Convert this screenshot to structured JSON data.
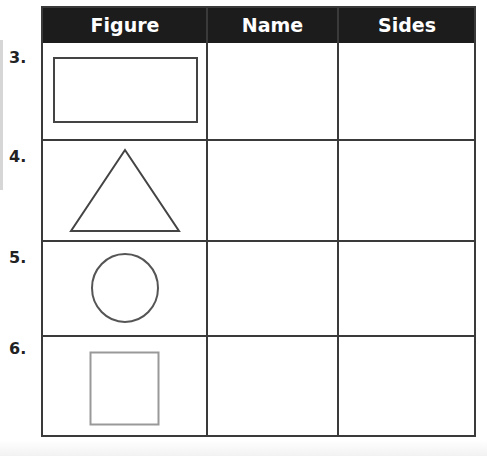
{
  "table": {
    "headers": [
      "Figure",
      "Name",
      "Sides"
    ],
    "header_bg": "#1c1c1c",
    "rows": [
      {
        "number": "3.",
        "figure": "rectangle",
        "name": "",
        "sides": ""
      },
      {
        "number": "4.",
        "figure": "triangle",
        "name": "",
        "sides": ""
      },
      {
        "number": "5.",
        "figure": "circle",
        "name": "",
        "sides": ""
      },
      {
        "number": "6.",
        "figure": "square",
        "name": "",
        "sides": ""
      }
    ]
  }
}
